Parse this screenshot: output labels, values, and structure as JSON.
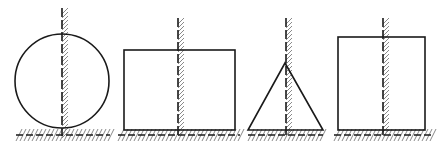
{
  "diagram": {
    "title": "",
    "stroke_color": "#1a1a1a",
    "hatch_color": "#8a8a8a",
    "figures": [
      {
        "name": "circle",
        "shape": "circle",
        "cx": 62,
        "cy": 81,
        "r": 47,
        "axis": {
          "x": 62,
          "y1": 8,
          "y2": 136
        },
        "base": {
          "x1": 16,
          "x2": 110,
          "y": 135
        }
      },
      {
        "name": "rectangle-wide",
        "shape": "rect",
        "x": 124,
        "y": 50,
        "w": 111,
        "h": 80,
        "axis": {
          "x": 178,
          "y1": 18,
          "y2": 136
        },
        "base": {
          "x1": 118,
          "x2": 240,
          "y": 135
        }
      },
      {
        "name": "triangle",
        "shape": "triangle",
        "points": [
          [
            285,
            63
          ],
          [
            248,
            130
          ],
          [
            323,
            130
          ]
        ],
        "axis": {
          "x": 286,
          "y1": 18,
          "y2": 136
        },
        "base": {
          "x1": 248,
          "x2": 323,
          "y": 135
        }
      },
      {
        "name": "rectangle-square",
        "shape": "rect",
        "x": 338,
        "y": 37,
        "w": 87,
        "h": 93,
        "axis": {
          "x": 383,
          "y1": 18,
          "y2": 136
        },
        "base": {
          "x1": 334,
          "x2": 432,
          "y": 135
        }
      }
    ]
  }
}
